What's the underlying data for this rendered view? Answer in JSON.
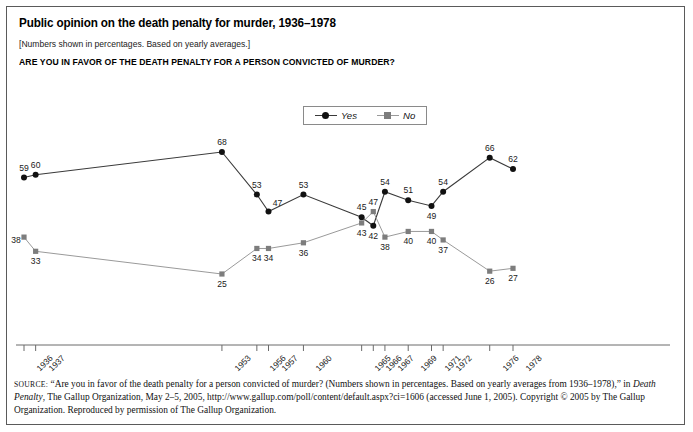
{
  "header": {
    "title": "Public opinion on the death penalty for murder, 1936–1978",
    "subtitle": "[Numbers shown in percentages. Based on yearly averages.]",
    "question": "ARE YOU IN FAVOR OF THE DEATH PENALTY FOR A PERSON CONVICTED OF MURDER?"
  },
  "legend": {
    "position": "top-center",
    "entries": [
      {
        "label": "Yes",
        "marker": "circle",
        "color": "#1a1a1a"
      },
      {
        "label": "No",
        "marker": "square",
        "color": "#8a8a8a"
      }
    ]
  },
  "colors": {
    "yes_line": "#3a3a3a",
    "yes_marker": "#111111",
    "no_line": "#9a9a9a",
    "no_marker": "#7d7d7d",
    "axis": "#6a6a6a",
    "border": "#5a5a5a",
    "text": "#111111"
  },
  "source": {
    "label": "SOURCE:",
    "line1": "“Are you in favor of the death penalty for a person convicted of murder? (Numbers shown in percentages. Based on yearly averages from 1936–1978),” in ",
    "italic_title": "Death Penalty",
    "line2": ", The Gallup Organization, May 2–5, 2005, http://www.gallup.com/poll/content/default.aspx?ci=1606 (accessed June 1, 2005). Copyright © 2005 by The Gallup Organization. Reproduced by permission of The Gallup Organization."
  },
  "chart_data": {
    "type": "line",
    "title": "Public opinion on the death penalty for murder, 1936–1978",
    "subtitle": "[Numbers shown in percentages. Based on yearly averages.]",
    "xlabel": "",
    "ylabel": "",
    "ylim": [
      20,
      72
    ],
    "grid": false,
    "legend_position": "top-center",
    "categories": [
      "1936",
      "1937",
      "1953",
      "1956",
      "1957",
      "1960",
      "1965",
      "1966",
      "1967",
      "1969",
      "1971",
      "1972",
      "1976",
      "1978"
    ],
    "x_numeric": [
      1936,
      1937,
      1953,
      1956,
      1957,
      1960,
      1965,
      1966,
      1967,
      1969,
      1971,
      1972,
      1976,
      1978
    ],
    "series": [
      {
        "name": "Yes",
        "marker": "circle",
        "color": "#1a1a1a",
        "values": [
          59,
          60,
          68,
          53,
          47,
          53,
          45,
          42,
          54,
          51,
          49,
          54,
          66,
          62
        ]
      },
      {
        "name": "No",
        "marker": "square",
        "color": "#8a8a8a",
        "values": [
          38,
          33,
          25,
          34,
          34,
          36,
          43,
          47,
          38,
          40,
          40,
          37,
          26,
          27
        ]
      }
    ],
    "label_offsets": {
      "Yes": [
        "above",
        "above",
        "above",
        "above",
        "below-right",
        "above",
        "above",
        "below",
        "above",
        "above",
        "below",
        "above",
        "above",
        "above"
      ],
      "No": [
        "above-left",
        "below",
        "below",
        "below",
        "below",
        "below",
        "below",
        "above",
        "below",
        "below",
        "below",
        "below",
        "below",
        "below"
      ]
    }
  }
}
